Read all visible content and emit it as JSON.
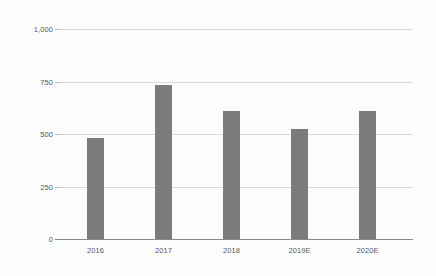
{
  "chart_data": {
    "type": "bar",
    "title": "",
    "subtitle": "",
    "xlabel": "",
    "ylabel": "",
    "categories": [
      "2016",
      "2017",
      "2018",
      "2019E",
      "2020E"
    ],
    "values": [
      480,
      735,
      610,
      525,
      610
    ],
    "series": [
      {
        "name": "Value",
        "values": [
          480,
          735,
          610,
          525,
          610
        ]
      }
    ],
    "ylim": [
      0,
      1000
    ],
    "yticks": [
      0,
      250,
      500,
      750,
      1000
    ],
    "ytick_labels": [
      "0",
      "250",
      "500",
      "750",
      "1,000"
    ],
    "grid": true,
    "legend": false,
    "legend_position": "none",
    "annotations": [],
    "colors": {
      "bar": "#7b7b7b",
      "gridline": "#d9d9d9",
      "axis": "#8a8a8a",
      "tick_label": "#58585a",
      "background": "#fcfcfc"
    }
  }
}
